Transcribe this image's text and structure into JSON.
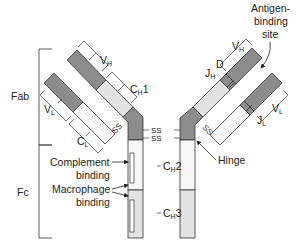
{
  "diagram": {
    "type": "antibody-structure",
    "regions": {
      "fab": "Fab",
      "fc": "Fc"
    },
    "domains": {
      "vh_left": {
        "main": "V",
        "sub": "H"
      },
      "vh_right": {
        "main": "V",
        "sub": "H"
      },
      "vl_left": {
        "main": "V",
        "sub": "L"
      },
      "vl_right": {
        "main": "V",
        "sub": "L"
      },
      "ch1": {
        "main": "C",
        "sub": "H",
        "suffix": "1"
      },
      "cl": {
        "main": "C",
        "sub": "L"
      },
      "ch2": {
        "main": "C",
        "sub": "H",
        "suffix": "2"
      },
      "ch3": {
        "main": "C",
        "sub": "H",
        "suffix": "3"
      },
      "jh": {
        "main": "J",
        "sub": "H"
      },
      "jl": {
        "main": "J",
        "sub": "L"
      },
      "d": "D"
    },
    "bonds": {
      "ss_hinge_1": "SS",
      "ss_hinge_2": "SS",
      "ss_left_lc": "SS",
      "ss_right_lc": "SS"
    },
    "annotations": {
      "antigen_line1": "Antigen-",
      "antigen_line2": "binding",
      "antigen_line3": "site",
      "hinge": "Hinge",
      "complement_line1": "Complement",
      "complement_line2": "binding",
      "macrophage_line1": "Macrophage",
      "macrophage_line2": "binding"
    },
    "colors": {
      "variable": "#8c8c8c",
      "constant_light": "#e2e2e2",
      "white": "#ffffff",
      "stroke": "#333333"
    }
  }
}
